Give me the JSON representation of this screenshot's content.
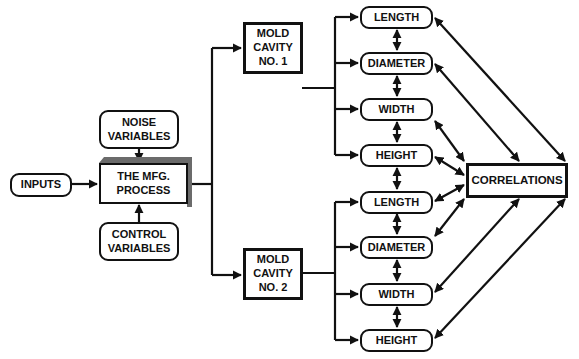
{
  "diagram": {
    "inputs": "INPUTS",
    "noise": [
      "NOISE",
      "VARIABLES"
    ],
    "process": [
      "THE MFG.",
      "PROCESS"
    ],
    "control": [
      "CONTROL",
      "VARIABLES"
    ],
    "cavity1": [
      "MOLD",
      "CAVITY",
      "NO. 1"
    ],
    "cavity2": [
      "MOLD",
      "CAVITY",
      "NO. 2"
    ],
    "cavity1_outputs": [
      "LENGTH",
      "DIAMETER",
      "WIDTH",
      "HEIGHT"
    ],
    "cavity2_outputs": [
      "LENGTH",
      "DIAMETER",
      "WIDTH",
      "HEIGHT"
    ],
    "correlations": "CORRELATIONS"
  },
  "colors": {
    "line": "#111111",
    "shadow": "#6b6b6b",
    "background": "#ffffff"
  }
}
